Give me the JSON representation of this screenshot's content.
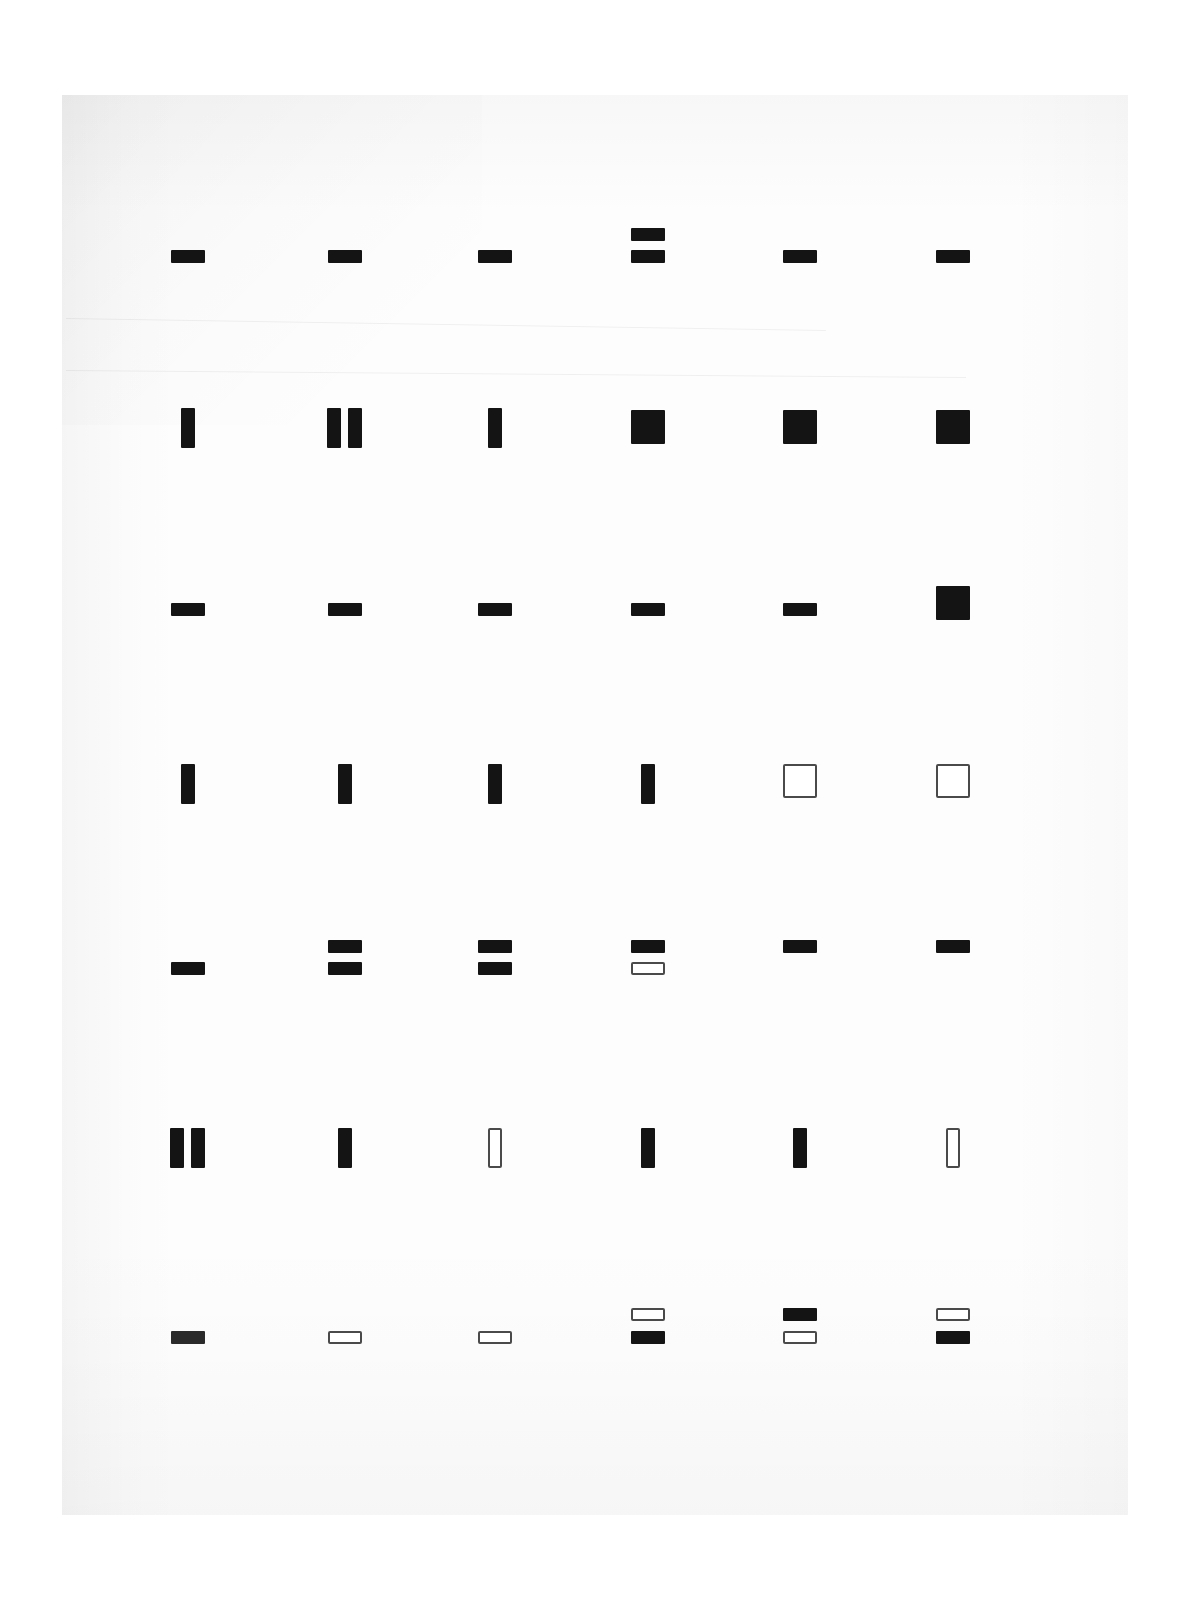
{
  "document": {
    "kind": "scanned-figure",
    "page_background": "#fdfdfd",
    "canvas_background": "#ffffff",
    "ink_color": "#141414",
    "outline_color": "#4a4a4a",
    "page_rect": {
      "left": 62,
      "top": 95,
      "width": 1066,
      "height": 1420
    }
  },
  "chart_data": {
    "type": "heatmap",
    "title": "",
    "subtitle": "",
    "xlabel": "",
    "ylabel": "",
    "grid": false,
    "legend": "none",
    "columns": [
      "1",
      "2",
      "3",
      "4",
      "5",
      "6"
    ],
    "rows": [
      "1",
      "2",
      "3",
      "4",
      "5",
      "6",
      "7"
    ],
    "column_centers_px": [
      188,
      345,
      495,
      648,
      800,
      953
    ],
    "row_baselines_px": [
      256,
      428,
      610,
      784,
      968,
      1148,
      1338
    ],
    "mark_shapes": {
      "hbar": {
        "width": 34,
        "height": 13
      },
      "vbar": {
        "width": 14,
        "height": 40
      },
      "square": {
        "width": 34,
        "height": 34
      },
      "hbar_wide": {
        "width": 38,
        "height": 14
      }
    },
    "cells": [
      {
        "row": 1,
        "col": 1,
        "marks": [
          {
            "shape": "hbar",
            "fill": "filled",
            "dx": -17,
            "dy": -6
          }
        ]
      },
      {
        "row": 1,
        "col": 2,
        "marks": [
          {
            "shape": "hbar",
            "fill": "filled",
            "dx": -17,
            "dy": -6
          }
        ]
      },
      {
        "row": 1,
        "col": 3,
        "marks": [
          {
            "shape": "hbar",
            "fill": "filled",
            "dx": -17,
            "dy": -6
          }
        ]
      },
      {
        "row": 1,
        "col": 4,
        "marks": [
          {
            "shape": "hbar",
            "fill": "filled",
            "dx": -17,
            "dy": -28
          },
          {
            "shape": "hbar",
            "fill": "filled",
            "dx": -17,
            "dy": -6
          }
        ]
      },
      {
        "row": 1,
        "col": 5,
        "marks": [
          {
            "shape": "hbar",
            "fill": "filled",
            "dx": -17,
            "dy": -6
          }
        ]
      },
      {
        "row": 1,
        "col": 6,
        "marks": [
          {
            "shape": "hbar",
            "fill": "filled",
            "dx": -17,
            "dy": -6
          }
        ]
      },
      {
        "row": 2,
        "col": 1,
        "marks": [
          {
            "shape": "vbar",
            "fill": "filled",
            "dx": -7,
            "dy": -20
          }
        ]
      },
      {
        "row": 2,
        "col": 2,
        "marks": [
          {
            "shape": "vbar",
            "fill": "filled",
            "dx": -18,
            "dy": -20
          },
          {
            "shape": "vbar",
            "fill": "filled",
            "dx": 3,
            "dy": -20
          }
        ]
      },
      {
        "row": 2,
        "col": 3,
        "marks": [
          {
            "shape": "vbar",
            "fill": "filled",
            "dx": -7,
            "dy": -20
          }
        ]
      },
      {
        "row": 2,
        "col": 4,
        "marks": [
          {
            "shape": "square",
            "fill": "filled",
            "dx": -17,
            "dy": -18
          }
        ]
      },
      {
        "row": 2,
        "col": 5,
        "marks": [
          {
            "shape": "square",
            "fill": "filled",
            "dx": -17,
            "dy": -18
          }
        ]
      },
      {
        "row": 2,
        "col": 6,
        "marks": [
          {
            "shape": "square",
            "fill": "filled",
            "dx": -17,
            "dy": -18
          }
        ]
      },
      {
        "row": 3,
        "col": 1,
        "marks": [
          {
            "shape": "hbar",
            "fill": "filled",
            "dx": -17,
            "dy": -7
          }
        ]
      },
      {
        "row": 3,
        "col": 2,
        "marks": [
          {
            "shape": "hbar",
            "fill": "filled",
            "dx": -17,
            "dy": -7
          }
        ]
      },
      {
        "row": 3,
        "col": 3,
        "marks": [
          {
            "shape": "hbar",
            "fill": "filled",
            "dx": -17,
            "dy": -7
          }
        ]
      },
      {
        "row": 3,
        "col": 4,
        "marks": [
          {
            "shape": "hbar",
            "fill": "filled",
            "dx": -17,
            "dy": -7
          }
        ]
      },
      {
        "row": 3,
        "col": 5,
        "marks": [
          {
            "shape": "hbar",
            "fill": "filled",
            "dx": -17,
            "dy": -7
          }
        ]
      },
      {
        "row": 3,
        "col": 6,
        "marks": [
          {
            "shape": "square",
            "fill": "filled",
            "dx": -17,
            "dy": -24
          }
        ]
      },
      {
        "row": 4,
        "col": 1,
        "marks": [
          {
            "shape": "vbar",
            "fill": "filled",
            "dx": -7,
            "dy": -20
          }
        ]
      },
      {
        "row": 4,
        "col": 2,
        "marks": [
          {
            "shape": "vbar",
            "fill": "filled",
            "dx": -7,
            "dy": -20
          }
        ]
      },
      {
        "row": 4,
        "col": 3,
        "marks": [
          {
            "shape": "vbar",
            "fill": "filled",
            "dx": -7,
            "dy": -20
          }
        ]
      },
      {
        "row": 4,
        "col": 4,
        "marks": [
          {
            "shape": "vbar",
            "fill": "filled",
            "dx": -7,
            "dy": -20
          }
        ]
      },
      {
        "row": 4,
        "col": 5,
        "marks": [
          {
            "shape": "square",
            "fill": "hollow",
            "dx": -17,
            "dy": -20
          }
        ]
      },
      {
        "row": 4,
        "col": 6,
        "marks": [
          {
            "shape": "square",
            "fill": "hollow",
            "dx": -17,
            "dy": -20
          }
        ]
      },
      {
        "row": 5,
        "col": 1,
        "marks": [
          {
            "shape": "hbar",
            "fill": "filled",
            "dx": -17,
            "dy": -6
          }
        ]
      },
      {
        "row": 5,
        "col": 2,
        "marks": [
          {
            "shape": "hbar",
            "fill": "filled",
            "dx": -17,
            "dy": -28
          },
          {
            "shape": "hbar",
            "fill": "filled",
            "dx": -17,
            "dy": -6
          }
        ]
      },
      {
        "row": 5,
        "col": 3,
        "marks": [
          {
            "shape": "hbar",
            "fill": "filled",
            "dx": -17,
            "dy": -28
          },
          {
            "shape": "hbar",
            "fill": "filled",
            "dx": -17,
            "dy": -6
          }
        ]
      },
      {
        "row": 5,
        "col": 4,
        "marks": [
          {
            "shape": "hbar",
            "fill": "filled",
            "dx": -17,
            "dy": -28
          },
          {
            "shape": "hbar",
            "fill": "hollow",
            "dx": -17,
            "dy": -6
          }
        ]
      },
      {
        "row": 5,
        "col": 5,
        "marks": [
          {
            "shape": "hbar",
            "fill": "filled",
            "dx": -17,
            "dy": -28
          }
        ]
      },
      {
        "row": 5,
        "col": 6,
        "marks": [
          {
            "shape": "hbar",
            "fill": "filled",
            "dx": -17,
            "dy": -28
          }
        ]
      },
      {
        "row": 6,
        "col": 1,
        "marks": [
          {
            "shape": "vbar",
            "fill": "filled",
            "dx": -18,
            "dy": -20
          },
          {
            "shape": "vbar",
            "fill": "filled",
            "dx": 3,
            "dy": -20
          }
        ]
      },
      {
        "row": 6,
        "col": 2,
        "marks": [
          {
            "shape": "vbar",
            "fill": "filled",
            "dx": -7,
            "dy": -20
          }
        ]
      },
      {
        "row": 6,
        "col": 3,
        "marks": [
          {
            "shape": "vbar",
            "fill": "hollow",
            "dx": -7,
            "dy": -20
          }
        ]
      },
      {
        "row": 6,
        "col": 4,
        "marks": [
          {
            "shape": "vbar",
            "fill": "filled",
            "dx": -7,
            "dy": -20
          }
        ]
      },
      {
        "row": 6,
        "col": 5,
        "marks": [
          {
            "shape": "vbar",
            "fill": "filled",
            "dx": -7,
            "dy": -20
          }
        ]
      },
      {
        "row": 6,
        "col": 6,
        "marks": [
          {
            "shape": "vbar",
            "fill": "hollow",
            "dx": -7,
            "dy": -20
          }
        ]
      },
      {
        "row": 7,
        "col": 1,
        "marks": [
          {
            "shape": "hbar",
            "fill": "filled-soft",
            "dx": -17,
            "dy": -7
          }
        ]
      },
      {
        "row": 7,
        "col": 2,
        "marks": [
          {
            "shape": "hbar",
            "fill": "hollow",
            "dx": -17,
            "dy": -7
          }
        ]
      },
      {
        "row": 7,
        "col": 3,
        "marks": [
          {
            "shape": "hbar",
            "fill": "hollow",
            "dx": -17,
            "dy": -7
          }
        ]
      },
      {
        "row": 7,
        "col": 4,
        "marks": [
          {
            "shape": "hbar",
            "fill": "hollow",
            "dx": -17,
            "dy": -30
          },
          {
            "shape": "hbar",
            "fill": "filled",
            "dx": -17,
            "dy": -7
          }
        ]
      },
      {
        "row": 7,
        "col": 5,
        "marks": [
          {
            "shape": "hbar",
            "fill": "filled",
            "dx": -17,
            "dy": -30
          },
          {
            "shape": "hbar",
            "fill": "hollow",
            "dx": -17,
            "dy": -7
          }
        ]
      },
      {
        "row": 7,
        "col": 6,
        "marks": [
          {
            "shape": "hbar",
            "fill": "hollow",
            "dx": -17,
            "dy": -30
          },
          {
            "shape": "hbar",
            "fill": "filled",
            "dx": -17,
            "dy": -7
          }
        ]
      }
    ]
  }
}
